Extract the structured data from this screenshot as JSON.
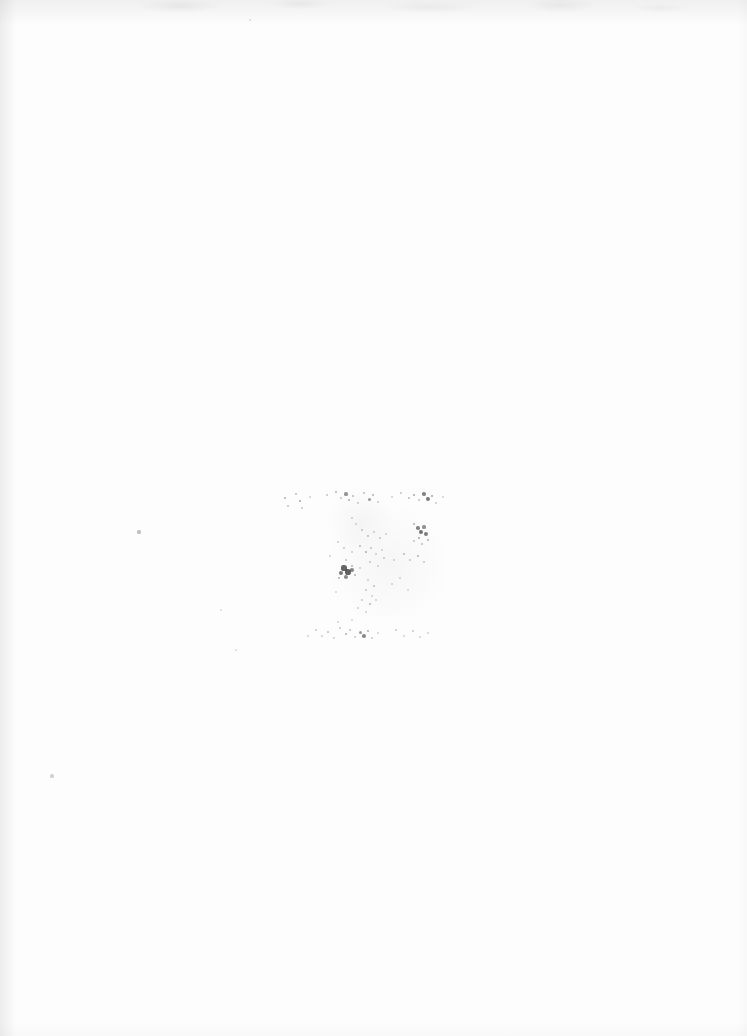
{
  "document": {
    "kind": "scanned-page",
    "title": "Blank scanned page with faint ink marks",
    "page_background": "#fdfdfd",
    "ink_color": "#3a3a3c",
    "width": 747,
    "height": 1036,
    "visible_text": "",
    "notes_label": "",
    "description": "Near-blank off-white scanned paper. A loose cluster of very faint, degraded ink specks occupies the middle of the page, arranged as a sparse upper row, a denser central group, and a sparse lower row. A few isolated specks appear elsewhere on the sheet."
  },
  "regions": [
    {
      "id": "upper-row",
      "label": "upper scattered row",
      "x": 282,
      "y": 490,
      "width": 160,
      "height": 26
    },
    {
      "id": "center-group",
      "label": "central dense cluster",
      "x": 330,
      "y": 515,
      "width": 110,
      "height": 110
    },
    {
      "id": "lower-row",
      "label": "lower scattered row",
      "x": 305,
      "y": 620,
      "width": 125,
      "height": 24
    },
    {
      "id": "stray-marks",
      "label": "isolated specks",
      "x": 40,
      "y": 510,
      "width": 220,
      "height": 280
    }
  ],
  "marks": {
    "upper_row": [
      {
        "x": 285,
        "y": 498,
        "r": 1.1,
        "o": 0.4
      },
      {
        "x": 288,
        "y": 506,
        "r": 0.9,
        "o": 0.3
      },
      {
        "x": 296,
        "y": 494,
        "r": 1.0,
        "o": 0.34
      },
      {
        "x": 300,
        "y": 501,
        "r": 1.4,
        "o": 0.46
      },
      {
        "x": 302,
        "y": 508,
        "r": 0.9,
        "o": 0.28
      },
      {
        "x": 310,
        "y": 497,
        "r": 0.8,
        "o": 0.22
      },
      {
        "x": 327,
        "y": 495,
        "r": 1.0,
        "o": 0.3
      },
      {
        "x": 336,
        "y": 492,
        "r": 1.2,
        "o": 0.38
      },
      {
        "x": 341,
        "y": 498,
        "r": 1.0,
        "o": 0.3
      },
      {
        "x": 346,
        "y": 494,
        "r": 1.6,
        "o": 0.52
      },
      {
        "x": 349,
        "y": 500,
        "r": 1.3,
        "o": 0.42
      },
      {
        "x": 353,
        "y": 496,
        "r": 1.0,
        "o": 0.33
      },
      {
        "x": 358,
        "y": 503,
        "r": 0.9,
        "o": 0.26
      },
      {
        "x": 364,
        "y": 493,
        "r": 1.1,
        "o": 0.32
      },
      {
        "x": 369,
        "y": 499,
        "r": 1.5,
        "o": 0.5
      },
      {
        "x": 373,
        "y": 495,
        "r": 1.2,
        "o": 0.38
      },
      {
        "x": 378,
        "y": 502,
        "r": 0.9,
        "o": 0.25
      },
      {
        "x": 392,
        "y": 497,
        "r": 0.8,
        "o": 0.22
      },
      {
        "x": 401,
        "y": 493,
        "r": 1.0,
        "o": 0.3
      },
      {
        "x": 409,
        "y": 498,
        "r": 1.1,
        "o": 0.34
      },
      {
        "x": 414,
        "y": 495,
        "r": 1.3,
        "o": 0.44
      },
      {
        "x": 419,
        "y": 500,
        "r": 1.0,
        "o": 0.32
      },
      {
        "x": 424,
        "y": 494,
        "r": 1.8,
        "o": 0.62
      },
      {
        "x": 428,
        "y": 499,
        "r": 2.0,
        "o": 0.66
      },
      {
        "x": 432,
        "y": 496,
        "r": 1.4,
        "o": 0.48
      },
      {
        "x": 436,
        "y": 503,
        "r": 0.9,
        "o": 0.26
      },
      {
        "x": 443,
        "y": 497,
        "r": 0.8,
        "o": 0.2
      }
    ],
    "center_group": [
      {
        "x": 352,
        "y": 518,
        "r": 0.9,
        "o": 0.26
      },
      {
        "x": 356,
        "y": 524,
        "r": 0.8,
        "o": 0.2
      },
      {
        "x": 362,
        "y": 530,
        "r": 1.0,
        "o": 0.3
      },
      {
        "x": 368,
        "y": 536,
        "r": 1.1,
        "o": 0.34
      },
      {
        "x": 374,
        "y": 532,
        "r": 0.9,
        "o": 0.24
      },
      {
        "x": 380,
        "y": 538,
        "r": 1.0,
        "o": 0.28
      },
      {
        "x": 386,
        "y": 534,
        "r": 0.8,
        "o": 0.2
      },
      {
        "x": 414,
        "y": 524,
        "r": 1.2,
        "o": 0.4
      },
      {
        "x": 418,
        "y": 528,
        "r": 1.8,
        "o": 0.62
      },
      {
        "x": 421,
        "y": 532,
        "r": 2.2,
        "o": 0.7
      },
      {
        "x": 424,
        "y": 527,
        "r": 1.6,
        "o": 0.54
      },
      {
        "x": 426,
        "y": 534,
        "r": 1.9,
        "o": 0.64
      },
      {
        "x": 419,
        "y": 538,
        "r": 1.4,
        "o": 0.46
      },
      {
        "x": 414,
        "y": 541,
        "r": 1.0,
        "o": 0.3
      },
      {
        "x": 422,
        "y": 544,
        "r": 1.1,
        "o": 0.34
      },
      {
        "x": 428,
        "y": 540,
        "r": 1.2,
        "o": 0.38
      },
      {
        "x": 338,
        "y": 542,
        "r": 0.9,
        "o": 0.24
      },
      {
        "x": 344,
        "y": 548,
        "r": 1.0,
        "o": 0.28
      },
      {
        "x": 352,
        "y": 552,
        "r": 0.9,
        "o": 0.24
      },
      {
        "x": 360,
        "y": 546,
        "r": 1.1,
        "o": 0.34
      },
      {
        "x": 366,
        "y": 552,
        "r": 1.3,
        "o": 0.42
      },
      {
        "x": 371,
        "y": 548,
        "r": 1.0,
        "o": 0.3
      },
      {
        "x": 376,
        "y": 554,
        "r": 0.9,
        "o": 0.24
      },
      {
        "x": 382,
        "y": 550,
        "r": 0.8,
        "o": 0.2
      },
      {
        "x": 346,
        "y": 560,
        "r": 1.0,
        "o": 0.3
      },
      {
        "x": 352,
        "y": 566,
        "r": 1.2,
        "o": 0.38
      },
      {
        "x": 344,
        "y": 568,
        "r": 2.6,
        "o": 0.78
      },
      {
        "x": 348,
        "y": 572,
        "r": 3.0,
        "o": 0.8
      },
      {
        "x": 341,
        "y": 573,
        "r": 2.2,
        "o": 0.68
      },
      {
        "x": 352,
        "y": 570,
        "r": 2.0,
        "o": 0.62
      },
      {
        "x": 346,
        "y": 577,
        "r": 1.8,
        "o": 0.56
      },
      {
        "x": 355,
        "y": 575,
        "r": 1.2,
        "o": 0.38
      },
      {
        "x": 339,
        "y": 578,
        "r": 1.3,
        "o": 0.4
      },
      {
        "x": 360,
        "y": 568,
        "r": 0.9,
        "o": 0.24
      },
      {
        "x": 370,
        "y": 562,
        "r": 1.0,
        "o": 0.28
      },
      {
        "x": 378,
        "y": 566,
        "r": 0.9,
        "o": 0.22
      },
      {
        "x": 384,
        "y": 558,
        "r": 1.0,
        "o": 0.28
      },
      {
        "x": 394,
        "y": 560,
        "r": 0.9,
        "o": 0.24
      },
      {
        "x": 404,
        "y": 554,
        "r": 1.1,
        "o": 0.34
      },
      {
        "x": 410,
        "y": 560,
        "r": 1.0,
        "o": 0.28
      },
      {
        "x": 418,
        "y": 556,
        "r": 1.2,
        "o": 0.38
      },
      {
        "x": 424,
        "y": 562,
        "r": 1.0,
        "o": 0.28
      },
      {
        "x": 368,
        "y": 580,
        "r": 0.9,
        "o": 0.24
      },
      {
        "x": 374,
        "y": 586,
        "r": 1.1,
        "o": 0.32
      },
      {
        "x": 366,
        "y": 590,
        "r": 1.0,
        "o": 0.28
      },
      {
        "x": 372,
        "y": 596,
        "r": 0.9,
        "o": 0.22
      },
      {
        "x": 362,
        "y": 600,
        "r": 1.0,
        "o": 0.28
      },
      {
        "x": 370,
        "y": 604,
        "r": 1.2,
        "o": 0.36
      },
      {
        "x": 376,
        "y": 600,
        "r": 0.9,
        "o": 0.22
      },
      {
        "x": 358,
        "y": 608,
        "r": 0.9,
        "o": 0.24
      },
      {
        "x": 366,
        "y": 612,
        "r": 0.8,
        "o": 0.2
      },
      {
        "x": 392,
        "y": 584,
        "r": 0.8,
        "o": 0.2
      },
      {
        "x": 400,
        "y": 578,
        "r": 0.9,
        "o": 0.22
      },
      {
        "x": 408,
        "y": 590,
        "r": 0.8,
        "o": 0.18
      },
      {
        "x": 336,
        "y": 592,
        "r": 0.8,
        "o": 0.18
      },
      {
        "x": 330,
        "y": 556,
        "r": 0.8,
        "o": 0.2
      }
    ],
    "lower_row": [
      {
        "x": 308,
        "y": 636,
        "r": 0.9,
        "o": 0.22
      },
      {
        "x": 316,
        "y": 630,
        "r": 1.0,
        "o": 0.28
      },
      {
        "x": 322,
        "y": 636,
        "r": 0.9,
        "o": 0.24
      },
      {
        "x": 328,
        "y": 632,
        "r": 1.1,
        "o": 0.32
      },
      {
        "x": 334,
        "y": 638,
        "r": 0.9,
        "o": 0.22
      },
      {
        "x": 340,
        "y": 628,
        "r": 1.0,
        "o": 0.28
      },
      {
        "x": 346,
        "y": 634,
        "r": 1.3,
        "o": 0.42
      },
      {
        "x": 350,
        "y": 630,
        "r": 1.1,
        "o": 0.32
      },
      {
        "x": 355,
        "y": 637,
        "r": 1.0,
        "o": 0.26
      },
      {
        "x": 360,
        "y": 632,
        "r": 1.5,
        "o": 0.5
      },
      {
        "x": 364,
        "y": 636,
        "r": 1.8,
        "o": 0.58
      },
      {
        "x": 368,
        "y": 631,
        "r": 1.3,
        "o": 0.42
      },
      {
        "x": 372,
        "y": 638,
        "r": 1.0,
        "o": 0.26
      },
      {
        "x": 378,
        "y": 633,
        "r": 0.8,
        "o": 0.2
      },
      {
        "x": 396,
        "y": 630,
        "r": 1.0,
        "o": 0.28
      },
      {
        "x": 404,
        "y": 636,
        "r": 0.9,
        "o": 0.22
      },
      {
        "x": 413,
        "y": 631,
        "r": 1.0,
        "o": 0.26
      },
      {
        "x": 420,
        "y": 637,
        "r": 0.8,
        "o": 0.2
      },
      {
        "x": 428,
        "y": 633,
        "r": 0.9,
        "o": 0.22
      },
      {
        "x": 338,
        "y": 622,
        "r": 0.8,
        "o": 0.18
      },
      {
        "x": 352,
        "y": 620,
        "r": 0.8,
        "o": 0.18
      }
    ],
    "stray": [
      {
        "x": 139,
        "y": 532,
        "r": 1.6,
        "o": 0.3
      },
      {
        "x": 221,
        "y": 610,
        "r": 1.2,
        "o": 0.16
      },
      {
        "x": 236,
        "y": 650,
        "r": 1.4,
        "o": 0.18
      },
      {
        "x": 52,
        "y": 776,
        "r": 1.6,
        "o": 0.22
      },
      {
        "x": 250,
        "y": 20,
        "r": 1.2,
        "o": 0.18
      }
    ]
  },
  "halos": [
    {
      "x": 388,
      "y": 565,
      "r": 62,
      "label": "central ghost halo"
    },
    {
      "x": 360,
      "y": 520,
      "r": 34,
      "label": "upper ghost halo"
    }
  ]
}
